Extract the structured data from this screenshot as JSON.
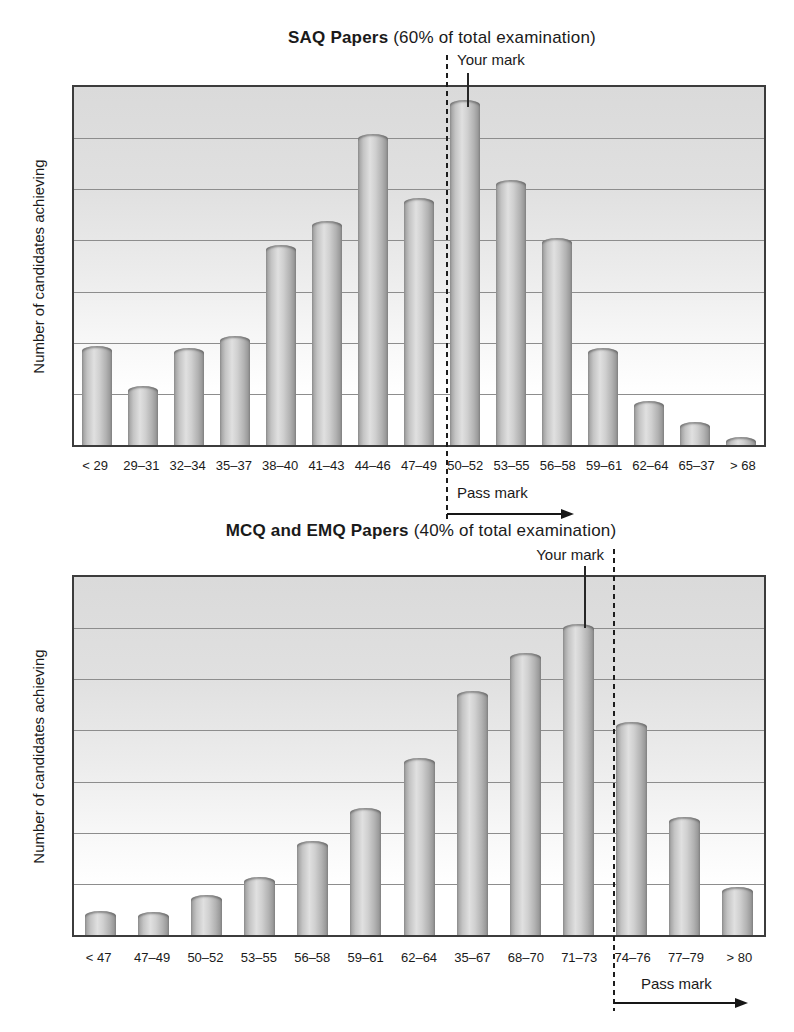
{
  "figure": {
    "y_axis_label": "Number of candidates achieving"
  },
  "chart_data": [
    {
      "type": "bar",
      "title": "SAQ Papers (60% of total examination)",
      "title_bold": "SAQ Papers",
      "title_rest": " (60% of total examination)",
      "ylabel": "Number of candidates achieving",
      "xlabel": "",
      "categories": [
        "< 29",
        "29–31",
        "32–34",
        "35–37",
        "38–40",
        "41–43",
        "44–46",
        "47–49",
        "50–52",
        "53–55",
        "56–58",
        "59–61",
        "62–64",
        "65–37",
        "> 68"
      ],
      "values_pct_of_plot_height": [
        27.6,
        16.6,
        27.1,
        30.4,
        55.8,
        62.7,
        87.0,
        69.1,
        96.4,
        74.0,
        57.7,
        27.1,
        12.2,
        6.4,
        2.2
      ],
      "gridlines": 6,
      "grid": "horizontal only, 6 internal lines, no numeric y ticks",
      "annotations": {
        "your_mark": "Your mark",
        "your_mark_category": "50–52",
        "pass_mark": "Pass mark",
        "pass_region_starts_before_category": "50–52"
      }
    },
    {
      "type": "bar",
      "title": "MCQ and EMQ Papers (40% of total examination)",
      "title_bold": "MCQ and EMQ Papers",
      "title_rest": " (40% of total examination)",
      "ylabel": "Number of candidates achieving",
      "xlabel": "",
      "categories": [
        "< 47",
        "47–49",
        "50–52",
        "53–55",
        "56–58",
        "59–61",
        "62–64",
        "35–67",
        "68–70",
        "71–73",
        "74–76",
        "77–79",
        "> 80"
      ],
      "values_pct_of_plot_height": [
        6.6,
        6.4,
        11.3,
        16.3,
        26.2,
        35.4,
        49.4,
        68.2,
        78.7,
        87.0,
        59.4,
        32.9,
        13.5
      ],
      "gridlines": 6,
      "grid": "horizontal only, 6 internal lines, no numeric y ticks",
      "annotations": {
        "your_mark": "Your mark",
        "your_mark_category": "71–73",
        "pass_mark": "Pass mark",
        "pass_region_starts_before_category": "74–76"
      }
    }
  ],
  "colors": {
    "bar_edge": "#8e8e8e",
    "bar_highlight": "#e0e0e0",
    "plot_background_top": "#dadada",
    "plot_background_bottom": "#ffffff",
    "gridline": "#8d8d8d",
    "plot_border": "#3c3c3c",
    "ink": "#1a1a1a"
  }
}
